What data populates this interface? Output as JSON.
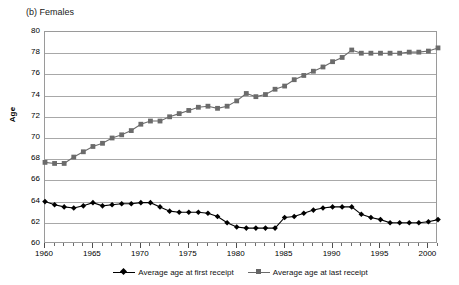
{
  "chart_data": {
    "type": "line",
    "title": "(b) Females",
    "xlabel": "",
    "ylabel": "Age",
    "xlim": [
      1960,
      2001
    ],
    "ylim": [
      60,
      80
    ],
    "y_ticks": [
      80,
      78,
      76,
      74,
      72,
      70,
      68,
      66,
      64,
      62,
      60
    ],
    "x_ticks": [
      1960,
      1965,
      1970,
      1975,
      1980,
      1985,
      1990,
      1995,
      2000
    ],
    "x_minor_step": 1,
    "grid": "horizontal",
    "legend_position": "bottom",
    "x": [
      1960,
      1961,
      1962,
      1963,
      1964,
      1965,
      1966,
      1967,
      1968,
      1969,
      1970,
      1971,
      1972,
      1973,
      1974,
      1975,
      1976,
      1977,
      1978,
      1979,
      1980,
      1981,
      1982,
      1983,
      1984,
      1985,
      1986,
      1987,
      1988,
      1989,
      1990,
      1991,
      1992,
      1993,
      1994,
      1995,
      1996,
      1997,
      1998,
      1999,
      2000,
      2001
    ],
    "series": [
      {
        "name": "Average age at first receipt",
        "marker": "diamond",
        "color": "#000000",
        "values": [
          64.0,
          63.7,
          63.5,
          63.4,
          63.6,
          63.9,
          63.6,
          63.7,
          63.8,
          63.8,
          63.9,
          63.9,
          63.5,
          63.1,
          63.0,
          63.0,
          63.0,
          62.9,
          62.6,
          62.0,
          61.6,
          61.5,
          61.5,
          61.5,
          61.5,
          62.5,
          62.6,
          62.9,
          63.2,
          63.4,
          63.5,
          63.5,
          63.5,
          62.8,
          62.5,
          62.3,
          62.0,
          62.0,
          62.0,
          62.0,
          62.1,
          62.3
        ]
      },
      {
        "name": "Average age at last receipt",
        "marker": "square",
        "color": "#6b6b6b",
        "values": [
          67.7,
          67.6,
          67.6,
          68.2,
          68.7,
          69.2,
          69.5,
          70.0,
          70.3,
          70.7,
          71.3,
          71.6,
          71.6,
          72.0,
          72.3,
          72.6,
          72.9,
          73.0,
          72.8,
          73.0,
          73.5,
          74.2,
          73.9,
          74.1,
          74.6,
          74.9,
          75.5,
          75.9,
          76.3,
          76.7,
          77.2,
          77.6,
          78.3,
          78.0,
          78.0,
          78.0,
          78.0,
          78.0,
          78.1,
          78.1,
          78.2,
          78.5
        ]
      }
    ]
  },
  "legend": {
    "entries": [
      {
        "label": "Average age at first receipt"
      },
      {
        "label": "Average age at last receipt"
      }
    ]
  }
}
